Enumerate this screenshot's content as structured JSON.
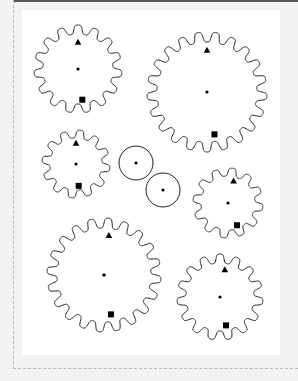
{
  "figure": {
    "panel": {
      "x": 22,
      "y": 10,
      "width": 258,
      "height": 345,
      "background": "#ffffff"
    },
    "mat_color": "#f2f2f2",
    "ink_color": "#231f20",
    "marker_color": "#000000",
    "guide_color": "#b9b9b9",
    "top_rule_color": "#58595b"
  },
  "chart_data": {
    "type": "scatter",
    "xlabel": "",
    "ylabel": "",
    "shapes": [
      {
        "name": "gear-top-left",
        "kind": "gear",
        "cx": 56,
        "cy": 59,
        "outer_radius": 44,
        "root_radius": 35,
        "teeth": 15,
        "phase_deg": 0,
        "hub_dot_radius": 1.6,
        "markers": [
          {
            "type": "triangle",
            "angle_deg": -90,
            "radius": 27,
            "size": 6
          },
          {
            "type": "square",
            "angle_deg": 82,
            "radius": 31,
            "size": 6
          }
        ]
      },
      {
        "name": "gear-top-right",
        "kind": "gear",
        "cx": 185,
        "cy": 82,
        "outer_radius": 60,
        "root_radius": 50,
        "teeth": 21,
        "phase_deg": 0,
        "hub_dot_radius": 1.6,
        "markers": [
          {
            "type": "triangle",
            "angle_deg": -90,
            "radius": 42,
            "size": 6
          },
          {
            "type": "square",
            "angle_deg": 80,
            "radius": 43,
            "size": 6
          }
        ]
      },
      {
        "name": "gear-middle-left",
        "kind": "gear",
        "cx": 54,
        "cy": 154,
        "outer_radius": 34,
        "root_radius": 26,
        "teeth": 12,
        "phase_deg": 0,
        "hub_dot_radius": 1.6,
        "markers": [
          {
            "type": "triangle",
            "angle_deg": -90,
            "radius": 21,
            "size": 6
          },
          {
            "type": "square",
            "angle_deg": 83,
            "radius": 22,
            "size": 6
          }
        ]
      },
      {
        "name": "disc-center-upper",
        "kind": "circle",
        "cx": 114,
        "cy": 153,
        "outer_radius": 17,
        "hub_dot_radius": 1.6,
        "markers": []
      },
      {
        "name": "disc-center-lower",
        "kind": "circle",
        "cx": 141,
        "cy": 180,
        "outer_radius": 17,
        "hub_dot_radius": 1.6,
        "markers": []
      },
      {
        "name": "gear-middle-right",
        "kind": "gear",
        "cx": 206,
        "cy": 193,
        "outer_radius": 35,
        "root_radius": 27,
        "teeth": 12,
        "phase_deg": 0,
        "hub_dot_radius": 1.6,
        "markers": [
          {
            "type": "triangle",
            "angle_deg": -76,
            "radius": 23,
            "size": 6
          },
          {
            "type": "square",
            "angle_deg": 68,
            "radius": 24,
            "size": 6
          }
        ]
      },
      {
        "name": "gear-bottom-left",
        "kind": "gear",
        "cx": 82,
        "cy": 265,
        "outer_radius": 57,
        "root_radius": 47,
        "teeth": 20,
        "phase_deg": 0,
        "hub_dot_radius": 1.8,
        "markers": [
          {
            "type": "triangle",
            "angle_deg": -83,
            "radius": 40,
            "size": 6
          },
          {
            "type": "square",
            "angle_deg": 80,
            "radius": 40,
            "size": 6
          }
        ]
      },
      {
        "name": "gear-bottom-right",
        "kind": "gear",
        "cx": 198,
        "cy": 287,
        "outer_radius": 43,
        "root_radius": 34,
        "teeth": 15,
        "phase_deg": 0,
        "hub_dot_radius": 1.6,
        "markers": [
          {
            "type": "triangle",
            "angle_deg": -80,
            "radius": 28,
            "size": 6
          },
          {
            "type": "square",
            "angle_deg": 78,
            "radius": 29,
            "size": 6
          }
        ]
      }
    ]
  }
}
